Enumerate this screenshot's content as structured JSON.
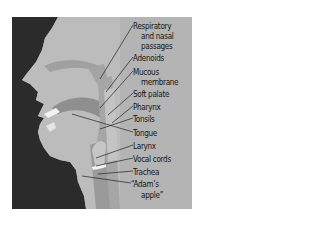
{
  "diagram": {
    "title": "",
    "colors": {
      "background": "#b4b4b4",
      "silhouette": "#2b2b2b",
      "tissue_dark": "#8f8f8f",
      "tissue_light": "#c6c6c6",
      "highlight": "#f2f2f2",
      "text": "#151515"
    },
    "labels": [
      {
        "text": "Respiratory",
        "x": 133,
        "y": 21
      },
      {
        "text": "and nasal",
        "x": 141,
        "y": 31
      },
      {
        "text": "passages",
        "x": 141,
        "y": 41
      },
      {
        "text": "Adenoids",
        "x": 133,
        "y": 53
      },
      {
        "text": "Mucous",
        "x": 133,
        "y": 67
      },
      {
        "text": "membrane",
        "x": 141,
        "y": 77
      },
      {
        "text": "Soft palate",
        "x": 133,
        "y": 89
      },
      {
        "text": "Pharynx",
        "x": 133,
        "y": 102
      },
      {
        "text": "Tonsils",
        "x": 133,
        "y": 114
      },
      {
        "text": "Tongue",
        "x": 133,
        "y": 128
      },
      {
        "text": "Larynx",
        "x": 133,
        "y": 141
      },
      {
        "text": "Vocal cords",
        "x": 133,
        "y": 154
      },
      {
        "text": "Trachea",
        "x": 133,
        "y": 167
      },
      {
        "text": "“Adam’s",
        "x": 131,
        "y": 179
      },
      {
        "text": "apple”",
        "x": 141,
        "y": 190
      }
    ]
  }
}
